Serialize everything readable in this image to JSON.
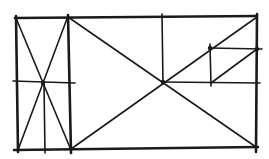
{
  "diagram": {
    "title": "",
    "stroke_color": "#1a1a1a",
    "background": "#ffffff",
    "lines": [
      {
        "id": "outer-top",
        "x1": 15,
        "y1": 18,
        "x2": 257,
        "y2": 16,
        "weight": "thick"
      },
      {
        "id": "outer-bottom",
        "x1": 14,
        "y1": 150,
        "x2": 258,
        "y2": 147,
        "weight": "thick"
      },
      {
        "id": "outer-left",
        "x1": 16,
        "y1": 16,
        "x2": 18,
        "y2": 152,
        "weight": "thick"
      },
      {
        "id": "outer-right",
        "x1": 257,
        "y1": 14,
        "x2": 256,
        "y2": 152,
        "weight": "thick"
      },
      {
        "id": "left-inner-vertical",
        "x1": 68,
        "y1": 15,
        "x2": 71,
        "y2": 153,
        "weight": "thick"
      },
      {
        "id": "left-diag-1",
        "x1": 16,
        "y1": 18,
        "x2": 71,
        "y2": 150,
        "weight": "thin"
      },
      {
        "id": "left-diag-2",
        "x1": 68,
        "y1": 16,
        "x2": 18,
        "y2": 150,
        "weight": "thin"
      },
      {
        "id": "left-horizontal",
        "x1": 13,
        "y1": 81,
        "x2": 75,
        "y2": 83,
        "weight": "thin"
      },
      {
        "id": "left-sub-vertical",
        "x1": 44,
        "y1": 84,
        "x2": 45,
        "y2": 153,
        "weight": "thin"
      },
      {
        "id": "big-diag-1",
        "x1": 68,
        "y1": 17,
        "x2": 256,
        "y2": 147,
        "weight": "thin"
      },
      {
        "id": "big-diag-2",
        "x1": 71,
        "y1": 149,
        "x2": 257,
        "y2": 17,
        "weight": "thin"
      },
      {
        "id": "mid-vertical",
        "x1": 162,
        "y1": 14,
        "x2": 163,
        "y2": 84,
        "weight": "thin"
      },
      {
        "id": "mid-horizontal",
        "x1": 163,
        "y1": 82,
        "x2": 260,
        "y2": 83,
        "weight": "thin"
      },
      {
        "id": "small-vertical",
        "x1": 210,
        "y1": 44,
        "x2": 211,
        "y2": 86,
        "weight": "thin"
      },
      {
        "id": "small-horizontal",
        "x1": 210,
        "y1": 48,
        "x2": 262,
        "y2": 49,
        "weight": "thin"
      },
      {
        "id": "small-diag",
        "x1": 211,
        "y1": 83,
        "x2": 257,
        "y2": 49,
        "weight": "thin"
      }
    ],
    "nodes": [
      {
        "id": "left-cross",
        "x": 43,
        "y": 83
      },
      {
        "id": "center-cross",
        "x": 163,
        "y": 82
      },
      {
        "id": "small-cross",
        "x": 210,
        "y": 48
      },
      {
        "id": "right-node",
        "x": 257,
        "y": 49
      }
    ]
  }
}
